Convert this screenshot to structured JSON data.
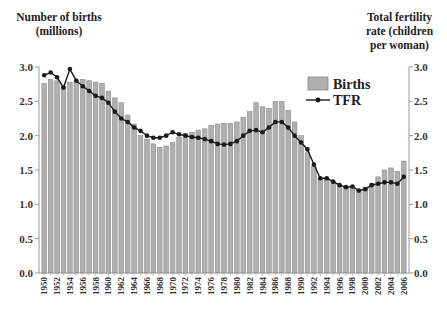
{
  "chart_data": {
    "type": "bar",
    "title": "",
    "ylabel_left": "Number of births (millions)",
    "ylabel_left_lines": [
      "Number of births",
      "(millions)"
    ],
    "ylabel_right": "Total fertility rate (children per woman)",
    "ylabel_right_lines": [
      "Total fertility",
      "rate (children",
      "per woman)"
    ],
    "xlabel": "",
    "ylim": [
      0,
      3.0
    ],
    "yticks": [
      "0.0",
      "0.5",
      "1.0",
      "1.5",
      "2.0",
      "2.5",
      "3.0"
    ],
    "ytick_values": [
      0,
      0.5,
      1.0,
      1.5,
      2.0,
      2.5,
      3.0
    ],
    "x": [
      1950,
      1951,
      1952,
      1953,
      1954,
      1955,
      1956,
      1957,
      1958,
      1959,
      1960,
      1961,
      1962,
      1963,
      1964,
      1965,
      1966,
      1967,
      1968,
      1969,
      1970,
      1971,
      1972,
      1973,
      1974,
      1975,
      1976,
      1977,
      1978,
      1979,
      1980,
      1981,
      1982,
      1983,
      1984,
      1985,
      1986,
      1987,
      1988,
      1989,
      1990,
      1991,
      1992,
      1993,
      1994,
      1995,
      1996,
      1997,
      1998,
      1999,
      2000,
      2001,
      2002,
      2003,
      2004,
      2005,
      2006
    ],
    "xtick_labels": [
      "1950",
      "1952",
      "1954",
      "1956",
      "1958",
      "1960",
      "1962",
      "1964",
      "1966",
      "1968",
      "1970",
      "1972",
      "1974",
      "1976",
      "1978",
      "1980",
      "1982",
      "1984",
      "1986",
      "1988",
      "1990",
      "1992",
      "1994",
      "1996",
      "1998",
      "2000",
      "2002",
      "2004",
      "2006"
    ],
    "legend": {
      "placement": "top-right",
      "entries": [
        "Births",
        "TFR"
      ]
    },
    "series": [
      {
        "name": "Births",
        "type": "bar",
        "color": "#b0b0b0",
        "values": [
          2.76,
          2.82,
          2.8,
          2.72,
          2.78,
          2.8,
          2.82,
          2.8,
          2.78,
          2.76,
          2.65,
          2.55,
          2.48,
          2.3,
          2.17,
          2.0,
          1.95,
          1.88,
          1.83,
          1.85,
          1.9,
          1.98,
          2.03,
          2.05,
          2.08,
          2.1,
          2.15,
          2.17,
          2.18,
          2.18,
          2.2,
          2.27,
          2.35,
          2.48,
          2.42,
          2.4,
          2.5,
          2.5,
          2.37,
          2.2,
          2.0,
          1.75,
          1.55,
          1.38,
          1.38,
          1.33,
          1.28,
          1.25,
          1.25,
          1.2,
          1.25,
          1.3,
          1.4,
          1.5,
          1.53,
          1.48,
          1.63
        ]
      },
      {
        "name": "TFR",
        "type": "line",
        "color": "#1a1a1a",
        "values": [
          2.88,
          2.92,
          2.85,
          2.7,
          2.97,
          2.8,
          2.72,
          2.65,
          2.58,
          2.55,
          2.48,
          2.35,
          2.25,
          2.2,
          2.12,
          2.07,
          2.0,
          1.97,
          1.97,
          2.0,
          2.05,
          2.02,
          2.0,
          1.98,
          1.97,
          1.95,
          1.92,
          1.88,
          1.87,
          1.88,
          1.92,
          2.0,
          2.07,
          2.08,
          2.05,
          2.12,
          2.2,
          2.2,
          2.12,
          2.0,
          1.9,
          1.8,
          1.58,
          1.38,
          1.38,
          1.33,
          1.28,
          1.25,
          1.26,
          1.2,
          1.22,
          1.28,
          1.3,
          1.32,
          1.32,
          1.3,
          1.4
        ]
      }
    ]
  }
}
